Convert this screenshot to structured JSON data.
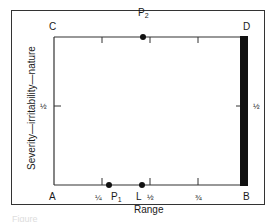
{
  "figure": {
    "corners": {
      "top_left": "C",
      "top_right": "D",
      "bottom_left": "A",
      "bottom_right": "B"
    },
    "x_axis": {
      "label": "Range",
      "ticks": [
        "¼",
        "½",
        "¾"
      ]
    },
    "y_axis": {
      "label": "Severity—irritability—nature",
      "left_tick": "½",
      "right_tick": "½"
    },
    "points": [
      {
        "name": "P",
        "subscript": "1",
        "position": "bottom edge, just right of ¼"
      },
      {
        "name": "L",
        "subscript": "",
        "position": "bottom edge, just left of ½"
      },
      {
        "name": "P",
        "subscript": "2",
        "position": "top edge, just left of ½"
      }
    ],
    "caption": "Figure"
  },
  "colors": {
    "line": "#333333",
    "bar": "#111111",
    "background": "#ffffff"
  }
}
